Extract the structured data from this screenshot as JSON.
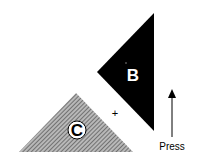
{
  "diagram": {
    "shapes": [
      {
        "id": "B",
        "label": "B",
        "fill": "#000000",
        "type": "triangle"
      },
      {
        "id": "C",
        "label": "C",
        "fill": "hatched-gray",
        "type": "triangle"
      }
    ],
    "center_mark": "+",
    "arrow": {
      "direction": "up",
      "label": "Press"
    },
    "colors": {
      "black": "#000000",
      "hatch_dark": "#555555",
      "hatch_light": "#bbbbbb",
      "background": "#ffffff"
    }
  }
}
